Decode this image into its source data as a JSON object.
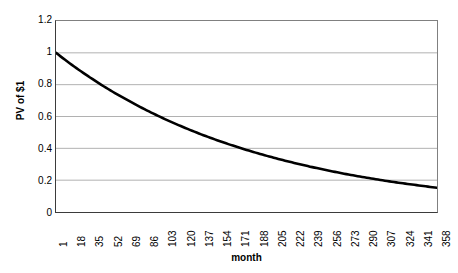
{
  "chart_data": {
    "type": "line",
    "title": "",
    "xlabel": "month",
    "ylabel": "PV of $1",
    "xlim": [
      1,
      358
    ],
    "ylim": [
      0,
      1.2
    ],
    "grid": true,
    "legend": null,
    "y_ticks": [
      "1.2",
      "1",
      "0.8",
      "0.6",
      "0.4",
      "0.2",
      "0"
    ],
    "y_tick_values": [
      1.2,
      1,
      0.8,
      0.6,
      0.4,
      0.2,
      0
    ],
    "x_ticks": [
      "1",
      "18",
      "35",
      "52",
      "69",
      "86",
      "103",
      "120",
      "137",
      "154",
      "171",
      "188",
      "205",
      "222",
      "239",
      "256",
      "273",
      "290",
      "307",
      "324",
      "341",
      "358"
    ],
    "x_tick_values": [
      1,
      18,
      35,
      52,
      69,
      86,
      103,
      120,
      137,
      154,
      171,
      188,
      205,
      222,
      239,
      256,
      273,
      290,
      307,
      324,
      341,
      358
    ],
    "series": [
      {
        "name": "PV of $1",
        "color": "#000000",
        "x": [
          1,
          18,
          35,
          52,
          69,
          86,
          103,
          120,
          137,
          154,
          171,
          188,
          205,
          222,
          239,
          256,
          273,
          290,
          307,
          324,
          341,
          358
        ],
        "values": [
          1.0,
          0.914,
          0.836,
          0.764,
          0.699,
          0.639,
          0.584,
          0.534,
          0.488,
          0.446,
          0.408,
          0.373,
          0.341,
          0.312,
          0.285,
          0.261,
          0.238,
          0.218,
          0.199,
          0.182,
          0.167,
          0.152
        ]
      }
    ]
  },
  "colors": {
    "curve": "#000000",
    "axis": "#3b3b3b",
    "frame": "#808080",
    "gridline": "#b0b0b0",
    "background": "#ffffff"
  }
}
